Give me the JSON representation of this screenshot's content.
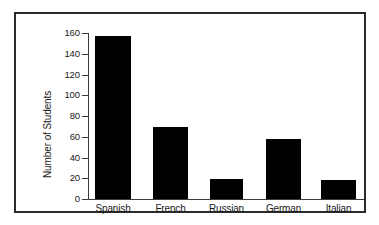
{
  "figure": {
    "background_color": "#ffffff",
    "frame_color": "#2b2b2b",
    "axis_color": "#3a3a3a",
    "bar_color": "#000000"
  },
  "chart_data": {
    "type": "bar",
    "title": "",
    "xlabel": "",
    "ylabel": "Number of Students",
    "categories": [
      "Spanish",
      "French",
      "Russian",
      "German",
      "Italian"
    ],
    "values": [
      157,
      69,
      19,
      58,
      18
    ],
    "ylim": [
      0,
      160
    ],
    "yticks": [
      0,
      20,
      40,
      60,
      80,
      100,
      120,
      140,
      160
    ],
    "ytick_labels": [
      "0",
      "20",
      "40",
      "60",
      "80",
      "100",
      "120",
      "140",
      "160"
    ],
    "grid": false,
    "legend": null,
    "legend_position": "none",
    "bar_color": "#000000",
    "orientation": "vertical"
  }
}
